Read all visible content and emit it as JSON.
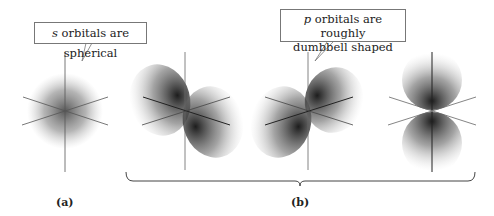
{
  "callouts": {
    "s": {
      "italic": "s",
      "text": " orbitals are spherical"
    },
    "p": {
      "italic": "p",
      "line1": " orbitals are roughly",
      "line2": "dumbbell shaped"
    }
  },
  "labels": {
    "a": "(a)",
    "b": "(b)"
  },
  "colors": {
    "orbital_dark": "#1a1a1a",
    "axis": "#555555",
    "background": "#ffffff"
  },
  "orbitals": [
    {
      "id": "s",
      "shape": "sphere",
      "group": "a"
    },
    {
      "id": "p1",
      "shape": "dumbbell",
      "orientation": "diagonal-front",
      "group": "b"
    },
    {
      "id": "p2",
      "shape": "dumbbell",
      "orientation": "diagonal-back",
      "group": "b"
    },
    {
      "id": "p3",
      "shape": "dumbbell",
      "orientation": "vertical",
      "group": "b"
    }
  ]
}
